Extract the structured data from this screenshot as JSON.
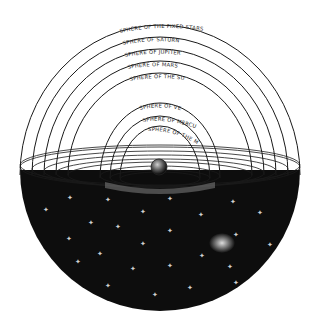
{
  "diagram": {
    "colors": {
      "background": "#ffffff",
      "ink": "#1a1a1a",
      "sky": "#0d0d0d",
      "star": "#cfcfcf",
      "nebula": "#e0e0e0"
    },
    "center": "earth",
    "spheres": [
      {
        "label": "SPHERE OF THE FIXED STARS",
        "r": 140
      },
      {
        "label": "SPHERE OF SATURN",
        "r": 128
      },
      {
        "label": "SPHERE OF JUPITER",
        "r": 116
      },
      {
        "label": "SPHERE OF MARS",
        "r": 104
      },
      {
        "label": "SPHERE OF THE SUN",
        "r": 92
      },
      {
        "label": "SPHERE OF VENUS",
        "r": 60
      },
      {
        "label": "SPHERE OF MERCURY",
        "r": 50
      },
      {
        "label": "SPHERE OF THE MOON",
        "r": 40
      }
    ]
  }
}
